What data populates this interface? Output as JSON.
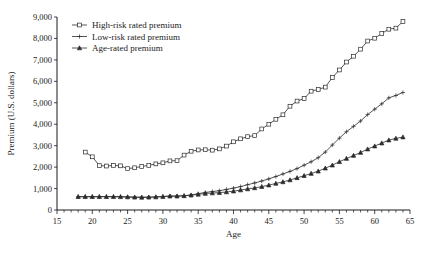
{
  "chart_data": {
    "type": "line",
    "title": "",
    "xlabel": "Age",
    "ylabel": "Premium (U.S. dollars)",
    "xlim": [
      15,
      65
    ],
    "ylim": [
      0,
      9000
    ],
    "xticks": [
      15,
      20,
      25,
      30,
      35,
      40,
      45,
      50,
      55,
      60,
      65
    ],
    "xtick_labels": [
      "15",
      "20",
      "25",
      "30",
      "35",
      "40",
      "45",
      "50",
      "55",
      "60",
      "65"
    ],
    "yticks": [
      0,
      1000,
      2000,
      3000,
      4000,
      5000,
      6000,
      7000,
      8000,
      9000
    ],
    "ytick_labels": [
      "0",
      "1,000",
      "2,000",
      "3,000",
      "4,000",
      "5,000",
      "6,000",
      "7,000",
      "8,000",
      "9,000"
    ],
    "x_minor_tick_step": 1,
    "grid": false,
    "legend_position": "top-left",
    "x": [
      18,
      19,
      20,
      21,
      22,
      23,
      24,
      25,
      26,
      27,
      28,
      29,
      30,
      31,
      32,
      33,
      34,
      35,
      36,
      37,
      38,
      39,
      40,
      41,
      42,
      43,
      44,
      45,
      46,
      47,
      48,
      49,
      50,
      51,
      52,
      53,
      54,
      55,
      56,
      57,
      58,
      59,
      60,
      61,
      62,
      63,
      64
    ],
    "series": [
      {
        "name": "High-risk rated premium",
        "marker": "open-square",
        "values": [
          null,
          2700,
          2480,
          2070,
          2050,
          2080,
          2060,
          1930,
          1970,
          2030,
          2080,
          2150,
          2200,
          2290,
          2300,
          2560,
          2740,
          2800,
          2810,
          2790,
          2850,
          2980,
          3180,
          3320,
          3420,
          3470,
          3780,
          4000,
          4230,
          4440,
          4840,
          5080,
          5200,
          5540,
          5620,
          5730,
          6180,
          6530,
          6900,
          7170,
          7500,
          7880,
          8010,
          8230,
          8430,
          8480,
          8790
        ]
      },
      {
        "name": "Low-risk rated premium",
        "marker": "plus",
        "values": [
          620,
          620,
          620,
          625,
          630,
          625,
          620,
          610,
          600,
          595,
          600,
          610,
          630,
          650,
          650,
          670,
          700,
          760,
          820,
          860,
          900,
          960,
          1020,
          1090,
          1180,
          1260,
          1350,
          1450,
          1560,
          1680,
          1800,
          1930,
          2090,
          2250,
          2440,
          2700,
          3030,
          3350,
          3650,
          3900,
          4150,
          4450,
          4700,
          4950,
          5230,
          5340,
          5480
        ]
      },
      {
        "name": "Age-rated premium",
        "marker": "filled-triangle",
        "values": [
          620,
          620,
          620,
          620,
          620,
          620,
          615,
          605,
          595,
          590,
          595,
          605,
          625,
          645,
          645,
          660,
          690,
          730,
          770,
          790,
          810,
          840,
          880,
          930,
          980,
          1030,
          1090,
          1160,
          1240,
          1310,
          1400,
          1500,
          1600,
          1700,
          1810,
          1950,
          2090,
          2250,
          2400,
          2540,
          2680,
          2840,
          2980,
          3120,
          3260,
          3340,
          3400
        ]
      }
    ]
  },
  "legend": {
    "items": [
      {
        "label": "High-risk rated premium",
        "marker": "open-square"
      },
      {
        "label": "Low-risk rated premium",
        "marker": "plus"
      },
      {
        "label": "Age-rated premium",
        "marker": "filled-triangle"
      }
    ]
  }
}
